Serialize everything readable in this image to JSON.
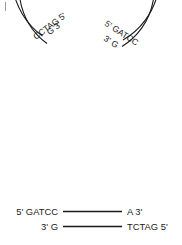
{
  "figure": {
    "stroke_color": "#1a1a1a",
    "background_color": "#ffffff"
  },
  "circular_dna": {
    "name": "circular-plasmid",
    "labels": {
      "left_outer": "G 3'",
      "left_inner": "CCTAG 5'",
      "right_outer": "5' GATCC",
      "right_inner": "3' G"
    }
  },
  "linear_dna": {
    "name": "linear-fragment",
    "top_strand": {
      "left_label": "5' GATCC",
      "right_label": "A 3'"
    },
    "bottom_strand": {
      "left_label": "3' G",
      "right_label": "TCTAG 5'"
    }
  }
}
